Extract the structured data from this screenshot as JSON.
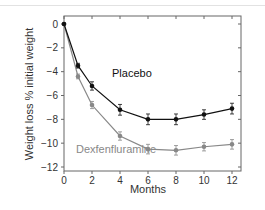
{
  "chart_data": {
    "type": "line",
    "title": "",
    "xlabel": "Months",
    "ylabel": "Weight loss % initial weight",
    "xlim": [
      0,
      12
    ],
    "ylim": [
      -12,
      0
    ],
    "x_ticks": [
      0,
      2,
      4,
      6,
      8,
      10,
      12
    ],
    "y_ticks": [
      0,
      -2,
      -4,
      -6,
      -8,
      -10,
      -12
    ],
    "grid": false,
    "legend_position": "inline labels",
    "x": [
      0,
      1,
      2,
      4,
      6,
      8,
      10,
      12
    ],
    "series": [
      {
        "name": "Placebo",
        "color": "#111111",
        "values": [
          0,
          -3.5,
          -5.2,
          -7.2,
          -8.0,
          -8.0,
          -7.6,
          -7.1
        ],
        "error": [
          0,
          0.2,
          0.35,
          0.45,
          0.45,
          0.45,
          0.4,
          0.45
        ]
      },
      {
        "name": "Dexfenfluramine",
        "color": "#888888",
        "values": [
          0,
          -4.4,
          -6.8,
          -9.4,
          -10.5,
          -10.6,
          -10.3,
          -10.1
        ],
        "error": [
          0,
          0.2,
          0.3,
          0.35,
          0.4,
          0.4,
          0.35,
          0.4
        ]
      }
    ]
  }
}
